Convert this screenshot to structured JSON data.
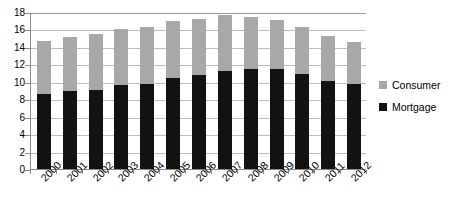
{
  "chart_data": {
    "type": "bar",
    "stacked": true,
    "title": "",
    "xlabel": "",
    "ylabel": "",
    "ylim": [
      0,
      18
    ],
    "ytick_step": 2,
    "yticks": [
      "0",
      "2",
      "4",
      "6",
      "8",
      "10",
      "12",
      "14",
      "16",
      "18"
    ],
    "grid": true,
    "legend_position": "right",
    "categories": [
      "2000",
      "2001",
      "2002",
      "2003",
      "2004",
      "2005",
      "2006",
      "2007",
      "2008",
      "2009",
      "2010",
      "2011",
      "2012"
    ],
    "series": [
      {
        "name": "Mortgage",
        "color": "#121212",
        "values": [
          8.6,
          8.9,
          9.1,
          9.6,
          9.8,
          10.4,
          10.8,
          11.2,
          11.5,
          11.5,
          10.9,
          10.1,
          9.7
        ]
      },
      {
        "name": "Consumer",
        "color": "#a8a8a8",
        "values": [
          6.1,
          6.2,
          6.4,
          6.4,
          6.5,
          6.6,
          6.4,
          6.5,
          5.9,
          5.6,
          5.4,
          5.1,
          4.9
        ]
      }
    ],
    "totals": [
      14.7,
      15.1,
      15.5,
      16.0,
      16.3,
      17.0,
      17.2,
      17.7,
      17.4,
      17.1,
      16.3,
      15.2,
      14.6
    ]
  },
  "legend": {
    "items": [
      {
        "label": "Consumer",
        "color": "#a8a8a8"
      },
      {
        "label": "Mortgage",
        "color": "#121212"
      }
    ]
  },
  "colors": {
    "axis": "#8a8a8a",
    "grid": "#bdbdbd",
    "background": "#ffffff"
  }
}
